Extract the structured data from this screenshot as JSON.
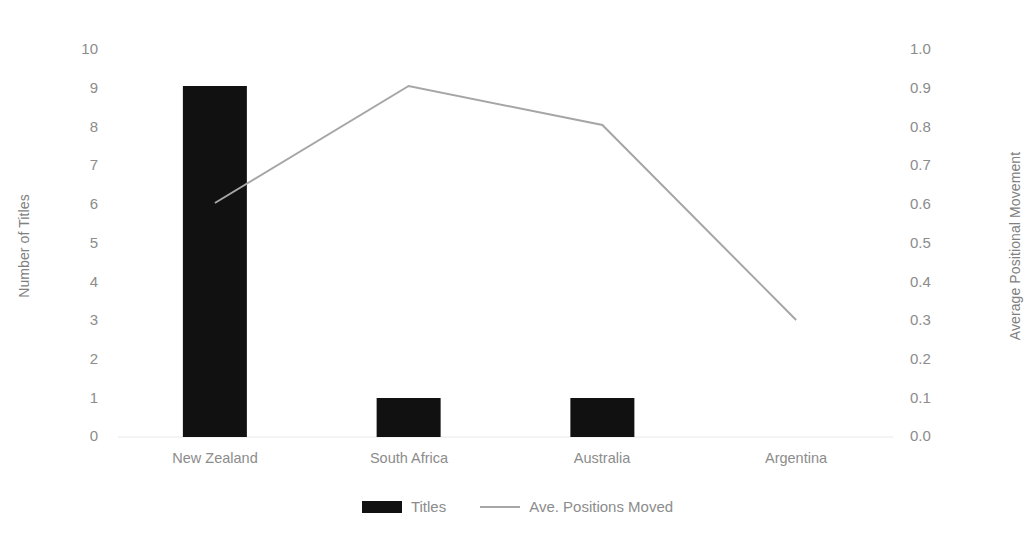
{
  "chart_data": {
    "type": "bar",
    "title": "",
    "subtitle": "",
    "xlabel": "",
    "ylabel": "Number of Titles",
    "y2label": "Average Positional Movement",
    "categories": [
      "New Zealand",
      "South Africa",
      "Australia",
      "Argentina"
    ],
    "series": [
      {
        "name": "Titles",
        "type": "bar",
        "axis": "left",
        "color": "#111111",
        "values": [
          9,
          1,
          1,
          0
        ]
      },
      {
        "name": "Ave. Positions Moved",
        "type": "line",
        "axis": "right",
        "color": "#a6a6a6",
        "values": [
          0.6,
          0.9,
          0.8,
          0.3
        ]
      }
    ],
    "ylim": [
      0,
      10
    ],
    "y2lim": [
      0.0,
      1.0
    ],
    "yticks": [
      "10",
      "9",
      "8",
      "7",
      "6",
      "5",
      "4",
      "3",
      "2",
      "1",
      "0"
    ],
    "y2ticks": [
      "1.0",
      "0.9",
      "0.8",
      "0.7",
      "0.6",
      "0.5",
      "0.4",
      "0.3",
      "0.2",
      "0.1",
      "0.0"
    ],
    "grid": false,
    "legend_position": "bottom-center",
    "legend": [
      "Titles",
      "Ave. Positions Moved"
    ]
  },
  "axes": {
    "left_title": "Number of Titles",
    "right_title": "Average Positional Movement"
  },
  "legend": {
    "bar_label": "Titles",
    "line_label": "Ave. Positions Moved"
  },
  "colors": {
    "bar": "#111111",
    "line": "#a6a6a6",
    "text": "#8c8c8c",
    "baseline": "#e8e8e8",
    "background": "#ffffff"
  }
}
